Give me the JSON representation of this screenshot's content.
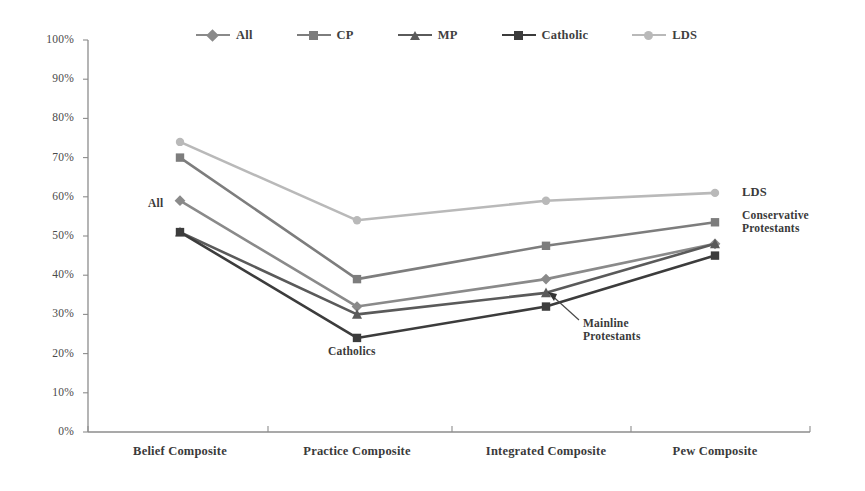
{
  "chart_data": {
    "type": "line",
    "title": "",
    "xlabel": "",
    "ylabel": "",
    "ylim": [
      0,
      100
    ],
    "y_ticks": [
      "0%",
      "10%",
      "20%",
      "30%",
      "40%",
      "50%",
      "60%",
      "70%",
      "80%",
      "90%",
      "100%"
    ],
    "grid": false,
    "legend_position": "top",
    "categories": [
      "Belief Composite",
      "Practice Composite",
      "Integrated Composite",
      "Pew Composite"
    ],
    "series": [
      {
        "name": "All",
        "marker": "diamond",
        "color": "#8a8a8a",
        "values": [
          59,
          32,
          39,
          48
        ]
      },
      {
        "name": "CP",
        "marker": "square",
        "color": "#7d7d7d",
        "values": [
          70,
          39,
          47.5,
          53.5
        ]
      },
      {
        "name": "MP",
        "marker": "triangle",
        "color": "#5a5a5a",
        "values": [
          51,
          30,
          35.5,
          48
        ]
      },
      {
        "name": "Catholic",
        "marker": "square",
        "color": "#3c3c3c",
        "values": [
          51,
          24,
          32,
          45
        ]
      },
      {
        "name": "LDS",
        "marker": "circle",
        "color": "#b9b9b9",
        "values": [
          74,
          54,
          59,
          61
        ]
      }
    ],
    "annotations": [
      {
        "text": "All",
        "series": "All",
        "category_index": 0,
        "placement": "left"
      },
      {
        "text": "Catholics",
        "series": "Catholic",
        "category_index": 1,
        "placement": "below"
      },
      {
        "text": "Mainline\nProtestants",
        "line1": "Mainline",
        "line2": "Protestants",
        "series": "MP",
        "category_index": 2,
        "placement": "leader-below-right"
      },
      {
        "text": "LDS",
        "series": "LDS",
        "category_index": 3,
        "placement": "right"
      },
      {
        "text": "Conservative\nProtestants",
        "line1": "Conservative",
        "line2": "Protestants",
        "series": "CP",
        "category_index": 3,
        "placement": "right"
      }
    ]
  },
  "legend": {
    "items": [
      {
        "label": "All",
        "marker": "diamond-icon",
        "color": "#8a8a8a"
      },
      {
        "label": "CP",
        "marker": "square-icon",
        "color": "#7d7d7d"
      },
      {
        "label": "MP",
        "marker": "triangle-icon",
        "color": "#5a5a5a"
      },
      {
        "label": "Catholic",
        "marker": "square-icon",
        "color": "#3c3c3c"
      },
      {
        "label": "LDS",
        "marker": "circle-icon",
        "color": "#b9b9b9"
      }
    ]
  },
  "axes": {
    "y_labels": [
      "100%",
      "90%",
      "80%",
      "70%",
      "60%",
      "50%",
      "40%",
      "30%",
      "20%",
      "10%",
      "0%"
    ],
    "x_labels": [
      "Belief Composite",
      "Practice Composite",
      "Integrated Composite",
      "Pew Composite"
    ],
    "axis_color": "#8d8d8d"
  },
  "annotations_text": {
    "all": "All",
    "catholics": "Catholics",
    "mainline_l1": "Mainline",
    "mainline_l2": "Protestants",
    "lds": "LDS",
    "conservative_l1": "Conservative",
    "conservative_l2": "Protestants"
  }
}
